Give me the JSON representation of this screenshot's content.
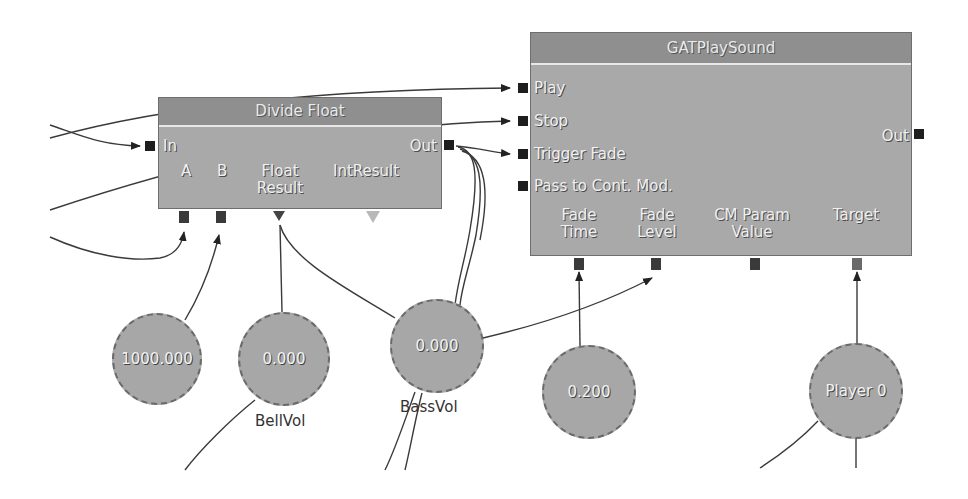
{
  "nodes": {
    "divide_float": {
      "title": "Divide Float",
      "inputs": [
        "In"
      ],
      "outputs": [
        "Out"
      ],
      "variable_links": [
        "A",
        "B",
        "Float Result",
        "IntResult"
      ],
      "float_label_1": "Float",
      "float_label_2": "Result"
    },
    "gat_play_sound": {
      "title": "GATPlaySound",
      "inputs": [
        "Play",
        "Stop",
        "Trigger Fade",
        "Pass to Cont. Mod."
      ],
      "outputs": [
        "Out"
      ],
      "variable_links": [
        {
          "line1": "Fade",
          "line2": "Time"
        },
        {
          "line1": "Fade",
          "line2": "Level"
        },
        {
          "line1": "CM Param",
          "line2": "Value"
        },
        {
          "line1": "Target",
          "line2": ""
        }
      ]
    }
  },
  "variables": [
    {
      "value": "1000.000",
      "name": ""
    },
    {
      "value": "0.000",
      "name": "BellVol"
    },
    {
      "value": "0.000",
      "name": "BassVol"
    },
    {
      "value": "0.200",
      "name": ""
    },
    {
      "value": "Player 0",
      "name": ""
    }
  ],
  "colors": {
    "node_body": "#a9a9a9",
    "node_title": "#8f8f8f",
    "port": "#1e1e1e",
    "wire": "#333333",
    "background": "#ffffff"
  }
}
